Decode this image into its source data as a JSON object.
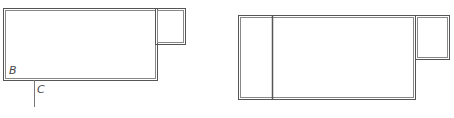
{
  "labels": {
    "b": "B",
    "c": "C"
  },
  "colors": {
    "line": "#555555",
    "background": "#ffffff"
  }
}
